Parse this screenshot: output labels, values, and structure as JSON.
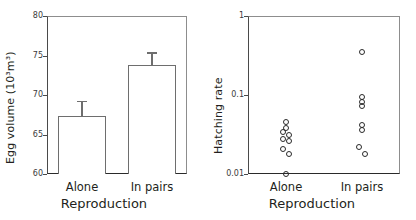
{
  "figure": {
    "panels": [
      "egg-volume-bar",
      "hatching-rate-scatter"
    ]
  },
  "chart_data": [
    {
      "type": "bar",
      "title": "",
      "xlabel": "Reproduction",
      "ylabel": "Egg volume (10³m³)",
      "categories": [
        "Alone",
        "In pairs"
      ],
      "values": [
        67.3,
        73.8
      ],
      "errors_upper": [
        2.0,
        1.6
      ],
      "error_style": "upper-only",
      "ylim": [
        60,
        80
      ],
      "yticks": [
        60,
        65,
        70,
        75,
        80
      ],
      "ytick_labels": [
        "60",
        "65",
        "70",
        "75",
        "80"
      ],
      "yscale": "linear",
      "grid": false,
      "legend": "none",
      "bar_fill": "#ffffff",
      "bar_edge": "#6e6e6e"
    },
    {
      "type": "scatter",
      "title": "",
      "xlabel": "Reproduction",
      "ylabel": "Hatching rate",
      "categories": [
        "Alone",
        "In pairs"
      ],
      "ylim": [
        0.01,
        1
      ],
      "yscale": "log",
      "yticks": [
        0.01,
        0.1,
        1
      ],
      "ytick_labels": [
        "0.01",
        "0.1",
        "1"
      ],
      "grid": false,
      "legend": "none",
      "marker": "open-circle",
      "marker_edge": "#2a2a2a",
      "series": [
        {
          "name": "Alone",
          "values": [
            0.045,
            0.038,
            0.034,
            0.031,
            0.028,
            0.026,
            0.021,
            0.018,
            0.01
          ]
        },
        {
          "name": "In pairs",
          "values": [
            0.35,
            0.093,
            0.082,
            0.072,
            0.042,
            0.036,
            0.022,
            0.018
          ]
        }
      ]
    }
  ]
}
